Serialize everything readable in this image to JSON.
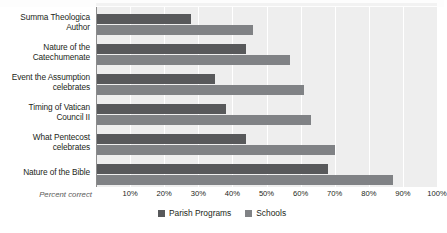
{
  "chart_data": {
    "type": "bar",
    "orientation": "horizontal",
    "title": "",
    "xlabel": "Percent correct",
    "ylabel": "",
    "xlim": [
      0,
      100
    ],
    "grid": true,
    "legend_position": "bottom",
    "categories": [
      "Summa Theologica Author",
      "Nature of the Catechumenate",
      "Event the Assumption celebrates",
      "Timing of Vatican Council II",
      "What Pentecost celebrates",
      "Nature of the Bible"
    ],
    "category_lines": [
      [
        "Summa Theologica",
        "Author"
      ],
      [
        "Nature of the",
        "Catechumenate"
      ],
      [
        "Event the Assumption",
        "celebrates"
      ],
      [
        "Timing of Vatican",
        "Council II"
      ],
      [
        "What Pentecost",
        "celebrates"
      ],
      [
        "Nature of the Bible"
      ]
    ],
    "series": [
      {
        "name": "Parish Programs",
        "color": "#58595b",
        "values": [
          28,
          44,
          35,
          38,
          44,
          68
        ]
      },
      {
        "name": "Schools",
        "color": "#808285",
        "values": [
          46,
          57,
          61,
          63,
          70,
          87
        ]
      }
    ],
    "ticks": [
      "10%",
      "20%",
      "30%",
      "40%",
      "50%",
      "60%",
      "70%",
      "80%",
      "90%",
      "100%"
    ],
    "tick_values": [
      10,
      20,
      30,
      40,
      50,
      60,
      70,
      80,
      90,
      100
    ]
  },
  "colors": {
    "plot_background": "#eeeeee",
    "gridline": "#ffffff",
    "axis": "#8c8c8c",
    "text": "#231f20",
    "axis_title_text": "#5a5a5a"
  }
}
